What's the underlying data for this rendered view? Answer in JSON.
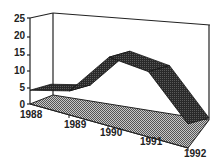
{
  "chart_data": {
    "type": "area",
    "style": "3d-ribbon",
    "title": "",
    "xlabel": "",
    "ylabel": "",
    "categories": [
      "1988",
      "1989",
      "1990",
      "1991",
      "1992"
    ],
    "series": [
      {
        "name": "Series 1",
        "values": [
          4,
          7,
          20,
          19,
          7
        ]
      }
    ],
    "yticks": [
      "0",
      "5",
      "10",
      "15",
      "20",
      "25"
    ],
    "ylim": [
      0,
      25
    ],
    "grid": false,
    "legend": "none",
    "colors": {
      "ribbon": "#3a3a3a",
      "ribbon_top": "#555555",
      "floor": "#8a8a8a",
      "axis": "#222222",
      "background": "#ffffff"
    }
  }
}
